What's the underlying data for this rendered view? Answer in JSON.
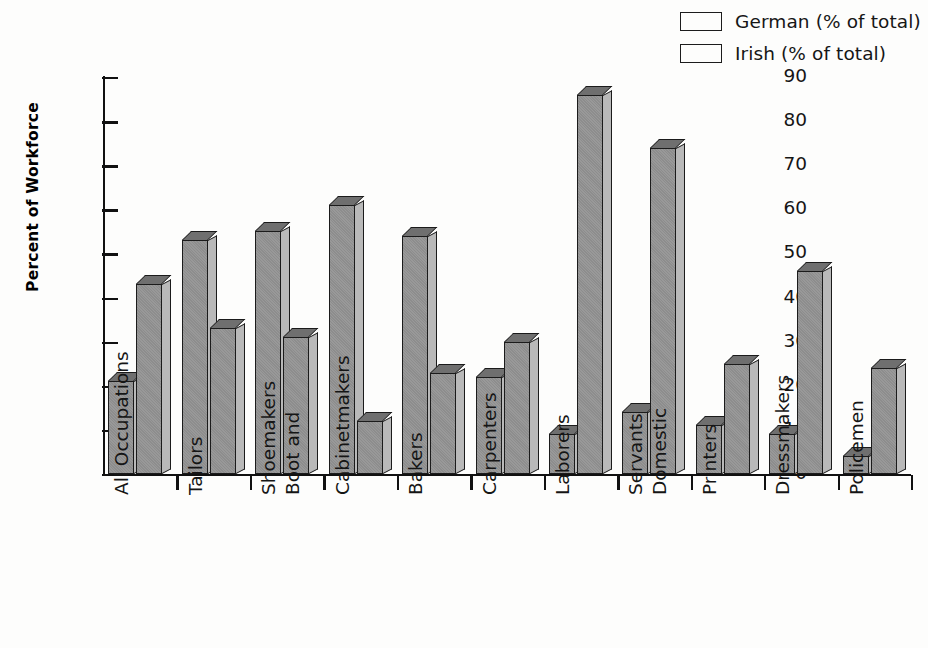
{
  "chart_data": {
    "type": "bar",
    "title": "",
    "xlabel": "",
    "ylabel": "Percent of Workforce",
    "ylim": [
      0,
      90
    ],
    "yticks": [
      0,
      10,
      20,
      30,
      40,
      50,
      60,
      70,
      80,
      90
    ],
    "grid": false,
    "legend_position": "top-right",
    "categories": [
      "All Occupations",
      "Tailors",
      "Boot and Shoemakers",
      "Cabinetmakers",
      "Bakers",
      "Carpenters",
      "Laborers",
      "Domestic Servants",
      "Printers",
      "Dressmakers",
      "Policemen"
    ],
    "category_lines": [
      [
        "All Occupations"
      ],
      [
        "Tailors"
      ],
      [
        "Boot and",
        "Shoemakers"
      ],
      [
        "Cabinetmakers"
      ],
      [
        "Bakers"
      ],
      [
        "Carpenters"
      ],
      [
        "Laborers"
      ],
      [
        "Domestic",
        "Servants"
      ],
      [
        "Printers"
      ],
      [
        "Dressmakers"
      ],
      [
        "Policemen"
      ]
    ],
    "series": [
      {
        "name": "German (% of total)",
        "color": "#8d8d8d",
        "values": [
          21,
          53,
          55,
          61,
          54,
          22,
          9,
          14,
          11,
          9,
          4
        ]
      },
      {
        "name": "Irish (% of total)",
        "color": "#8d8d8d",
        "values": [
          43,
          33,
          31,
          12,
          23,
          30,
          86,
          74,
          25,
          46,
          24
        ]
      }
    ]
  },
  "legend": {
    "items": [
      {
        "label": "German (% of total)",
        "swatch": "#8d8d8d"
      },
      {
        "label": "Irish (% of total)",
        "swatch": "#8d8d8d"
      }
    ]
  },
  "axes": {
    "y_title": "Percent of Workforce"
  },
  "colors": {
    "bar_front": "#8d8d8d",
    "bar_side": "#b9b9b9",
    "bar_top": "#6f6f6f",
    "outline": "#1b1b1b",
    "background": "#fdfdfc"
  }
}
